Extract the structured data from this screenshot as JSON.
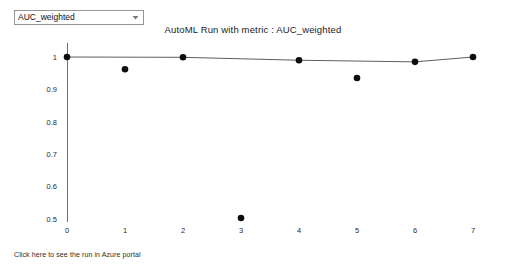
{
  "metric_selector": {
    "selected": "AUC_weighted",
    "options": [
      "AUC_weighted"
    ],
    "arrow_icon": "chevron-down-icon"
  },
  "footer": {
    "link_text": "Click here to see the run in Azure portal"
  },
  "colors": {
    "dot": "#0d0d0d",
    "line": "#5d5d5d",
    "axis": "#6d6d6d",
    "text": "#1b1b1b",
    "background": "#ffffff"
  },
  "chart_data": {
    "type": "scatter",
    "title": "AutoML Run with metric : AUC_weighted",
    "xlabel": "",
    "ylabel": "",
    "grid": false,
    "legend": "none",
    "xlim": [
      -0.35,
      7.35
    ],
    "ylim": [
      0.46,
      1.02
    ],
    "xticks": [
      0,
      1,
      2,
      3,
      4,
      5,
      6,
      7
    ],
    "xtick_labels": [
      "0",
      "1",
      "2",
      "3",
      "4",
      "5",
      "6",
      "7"
    ],
    "yticks": [
      0.5,
      0.6,
      0.7,
      0.8,
      0.9,
      1
    ],
    "ytick_labels": [
      "0.5",
      "0.6",
      "0.7",
      "0.8",
      "0.9",
      "1"
    ],
    "x": [
      0,
      1,
      2,
      3,
      4,
      5,
      6,
      7
    ],
    "values": [
      1.0,
      0.962,
      0.999,
      0.503,
      0.99,
      0.935,
      0.985,
      1.0
    ],
    "series": [
      {
        "name": "iteration metric",
        "render": "markers",
        "x": [
          0,
          1,
          2,
          3,
          4,
          5,
          6,
          7
        ],
        "values": [
          1.0,
          0.962,
          0.999,
          0.503,
          0.99,
          0.935,
          0.985,
          1.0
        ]
      },
      {
        "name": "best so far",
        "render": "line",
        "x": [
          0,
          2,
          4,
          6,
          7
        ],
        "values": [
          1.0,
          0.999,
          0.99,
          0.985,
          1.0
        ]
      }
    ]
  }
}
